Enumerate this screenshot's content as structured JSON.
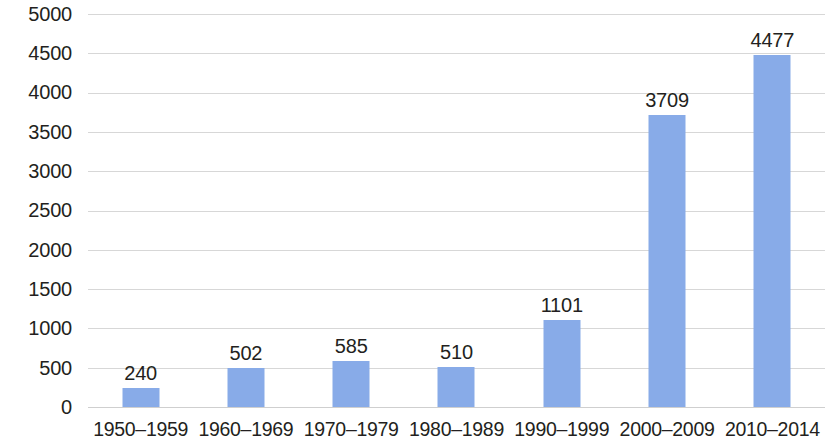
{
  "chart_data": {
    "type": "bar",
    "title": "",
    "subtitle": "",
    "xlabel": "",
    "ylabel": "",
    "categories": [
      "1950–1959",
      "1960–1969",
      "1970–1979",
      "1980–1989",
      "1990–1999",
      "2000–2009",
      "2010–2014"
    ],
    "values": [
      240,
      502,
      585,
      510,
      1101,
      3709,
      4477
    ],
    "value_labels": [
      "240",
      "502",
      "585",
      "510",
      "1101",
      "3709",
      "4477"
    ],
    "ylim": [
      0,
      5000
    ],
    "ytick_values": [
      0,
      500,
      1000,
      1500,
      2000,
      2500,
      3000,
      3500,
      4000,
      4500,
      5000
    ],
    "ytick_labels": [
      "0",
      "500",
      "1000",
      "1500",
      "2000",
      "2500",
      "3000",
      "3500",
      "4000",
      "4500",
      "5000"
    ],
    "grid": true,
    "legend": false,
    "legend_position": "none",
    "series": [
      {
        "name": "",
        "values": [
          240,
          502,
          585,
          510,
          1101,
          3709,
          4477
        ]
      }
    ],
    "colors": {
      "bar": "#88ABE8",
      "gridline": "#d7d7d7",
      "text": "#231f20",
      "background": "#ffffff"
    }
  }
}
